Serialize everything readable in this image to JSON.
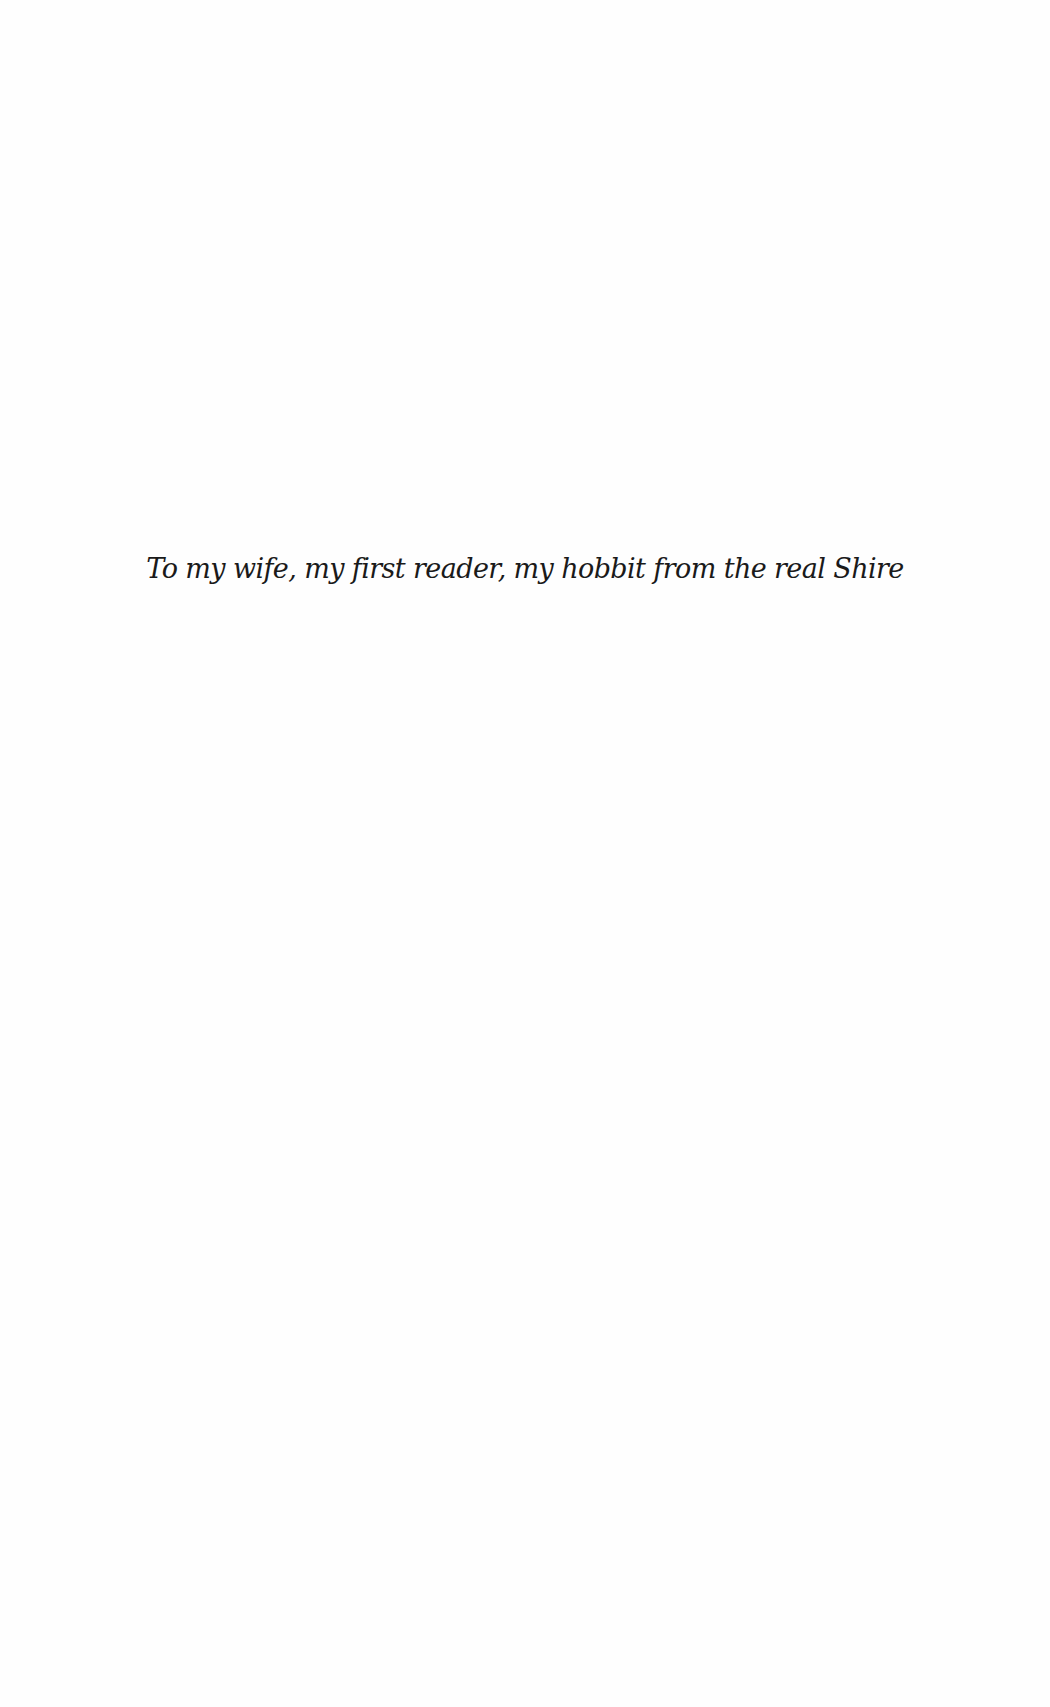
{
  "page": {
    "dedication": "To my wife, my first reader, my hobbit from the real Shire"
  }
}
